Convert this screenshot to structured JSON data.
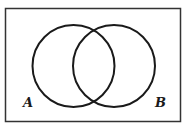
{
  "diagram": {
    "type": "venn",
    "sets": [
      {
        "label": "A",
        "cx": 73.5,
        "cy": 66,
        "r": 41
      },
      {
        "label": "B",
        "cx": 114,
        "cy": 66,
        "r": 41
      }
    ],
    "universe": {
      "x": 5.5,
      "y": 8.5,
      "width": 175,
      "height": 113
    },
    "stroke_color": "#1a1a1a"
  }
}
